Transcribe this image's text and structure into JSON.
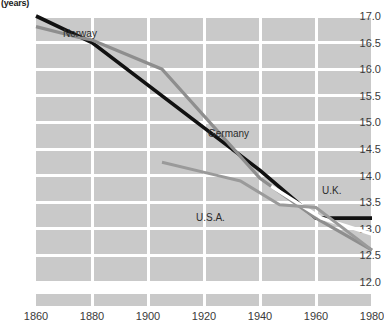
{
  "chart_data": {
    "type": "line",
    "title": "",
    "ylabel": "(years)",
    "xlabel": "",
    "xlim": [
      1860,
      1980
    ],
    "ylim": [
      12.0,
      17.0
    ],
    "grid": true,
    "legend_position": "inline-annotations",
    "xticks": [
      1860,
      1880,
      1900,
      1920,
      1940,
      1960,
      1980
    ],
    "yticks": [
      12.0,
      12.5,
      13.0,
      13.5,
      14.0,
      14.5,
      15.0,
      15.5,
      16.0,
      16.5,
      17.0
    ],
    "ytick_labels": [
      "12.0",
      "12.5",
      "13.0",
      "13.5",
      "14.0",
      "14.5",
      "15.0",
      "15.5",
      "16.0",
      "16.5",
      "17.0"
    ],
    "xtick_labels": [
      "1860",
      "1880",
      "1900",
      "1920",
      "1940",
      "1960",
      "1980"
    ],
    "series": [
      {
        "name": "Norway",
        "color": "#111111",
        "x": [
          1860,
          1880,
          1940,
          1960,
          1980
        ],
        "values": [
          17.0,
          16.5,
          14.1,
          13.2,
          13.2
        ]
      },
      {
        "name": "Germany",
        "color": "#8e8e8e",
        "x": [
          1860,
          1875,
          1880,
          1905,
          1940,
          1960,
          1980
        ],
        "values": [
          16.8,
          16.6,
          16.55,
          16.0,
          13.95,
          13.2,
          12.6
        ]
      },
      {
        "name": "U.K.",
        "color": "#ffffff",
        "x": [
          1944,
          1962,
          1980
        ],
        "values": [
          13.8,
          13.2,
          12.9
        ]
      },
      {
        "name": "U.S.A.",
        "color": "#9a9a9a",
        "x": [
          1905,
          1925,
          1933,
          1947,
          1960,
          1980
        ],
        "values": [
          14.25,
          14.0,
          13.9,
          13.45,
          13.4,
          12.6
        ]
      }
    ]
  },
  "labels": {
    "unit": "(years)",
    "norway": "Norway",
    "germany": "Germany",
    "uk": "U.K.",
    "usa": "U.S.A."
  },
  "colors": {
    "plot_background": "#c9c9c9",
    "gridline": "#ffffff",
    "page_background": "#ffffff",
    "tick_text": "#3a3a3a",
    "norway": "#111111",
    "germany": "#8e8e8e",
    "uk": "#ffffff",
    "usa": "#9a9a9a"
  }
}
